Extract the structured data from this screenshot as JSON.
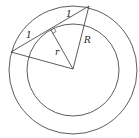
{
  "diagram": {
    "outer_circle": {
      "cx": 73,
      "cy": 70,
      "r": 64,
      "label": "R"
    },
    "inner_circle": {
      "cx": 73,
      "cy": 70,
      "r": 46,
      "label": "r"
    },
    "chord": {
      "x1": 11,
      "y1": 52,
      "x2": 89,
      "y2": 6
    },
    "tangent_point": {
      "x": 51,
      "y": 30
    },
    "labels": {
      "left_half": "1",
      "right_half": "1",
      "inner_radius": "r",
      "outer_radius": "R"
    },
    "stroke_color": "#333333"
  }
}
